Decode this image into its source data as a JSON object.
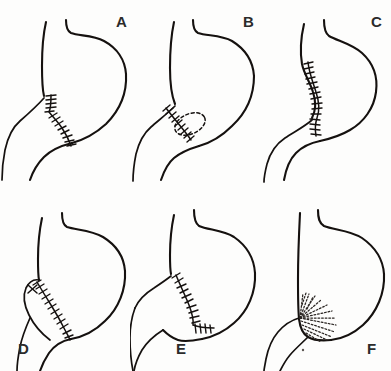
{
  "figure": {
    "kind": "medical-line-drawing-plate",
    "background_color": "#fdfdfc",
    "ink_color": "#15110f",
    "width": 391,
    "height": 371,
    "columns": 3,
    "rows": 2,
    "caption": "",
    "panels": [
      {
        "id": "A",
        "label": "A",
        "label_x": 116,
        "label_y": 14,
        "panel_x": 0,
        "panel_y": 0,
        "subject": "stomach-and-duodenum-outline",
        "features": [
          "longitudinal-suture-line",
          "antrum-outline",
          "duodenal-limb"
        ],
        "suture_style": "continuous-ticked",
        "suture_tick_count": 22,
        "has_dashed_excision": false,
        "has_x_mark": false,
        "has_radiating_sutures": false
      },
      {
        "id": "B",
        "label": "B",
        "label_x": 243,
        "label_y": 14,
        "panel_x": 130,
        "panel_y": 0,
        "subject": "stomach-and-duodenum-outline",
        "features": [
          "oblique-suture-line",
          "dashed-excision-oval",
          "duodenal-limb"
        ],
        "suture_style": "continuous-ticked",
        "suture_tick_count": 17,
        "has_dashed_excision": true,
        "has_x_mark": false,
        "has_radiating_sutures": false
      },
      {
        "id": "C",
        "label": "C",
        "label_x": 371,
        "label_y": 14,
        "panel_x": 258,
        "panel_y": 0,
        "subject": "stomach-and-duodenum-outline",
        "features": [
          "long-curved-suture-line",
          "deep-incisura",
          "duodenal-limb"
        ],
        "suture_style": "continuous-ticked",
        "suture_tick_count": 30,
        "has_dashed_excision": false,
        "has_x_mark": false,
        "has_radiating_sutures": false
      },
      {
        "id": "D",
        "label": "D",
        "label_x": 18,
        "label_y": 341,
        "panel_x": 0,
        "panel_y": 185,
        "subject": "stomach-and-duodenum-outline",
        "features": [
          "oblique-suture-line",
          "x-marker-at-apex",
          "duodenal-limb"
        ],
        "suture_style": "continuous-ticked",
        "suture_tick_count": 24,
        "has_dashed_excision": false,
        "has_x_mark": true,
        "has_radiating_sutures": false
      },
      {
        "id": "E",
        "label": "E",
        "label_x": 176,
        "label_y": 341,
        "panel_x": 130,
        "panel_y": 185,
        "subject": "stomach-and-duodenum-outline",
        "features": [
          "angled-suture-line",
          "horizontal-suture-run",
          "duodenal-limb"
        ],
        "suture_style": "continuous-ticked",
        "suture_tick_count": 26,
        "has_dashed_excision": false,
        "has_x_mark": false,
        "has_radiating_sutures": false
      },
      {
        "id": "F",
        "label": "F",
        "label_x": 367,
        "label_y": 341,
        "panel_x": 258,
        "panel_y": 185,
        "subject": "stomach-and-duodenum-outline",
        "features": [
          "radiating-dotted-sutures",
          "fan-pattern",
          "duodenal-limb"
        ],
        "suture_style": "radiating-dotted",
        "suture_tick_count": 0,
        "has_dashed_excision": false,
        "has_x_mark": false,
        "has_radiating_sutures": true,
        "radiating_line_count": 14,
        "has_ink_speck": true
      }
    ]
  }
}
